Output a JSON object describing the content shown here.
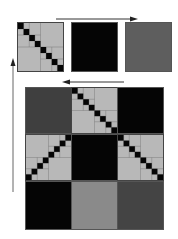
{
  "colors": {
    "background": "#ffffff",
    "light_gray": "#b8b8b8",
    "medium_gray": "#8a8a8a",
    "dark_gray": "#444444",
    "black": "#050505",
    "arrow": "#333333"
  },
  "top_row": {
    "cells": [
      {
        "type": "diagonal",
        "orientation": "main"
      },
      {
        "type": "solid",
        "fill": "black"
      },
      {
        "type": "solid",
        "fill": "dark_gray_medium"
      }
    ]
  },
  "arrows": [
    {
      "name": "top-right-arrow",
      "direction": "right"
    },
    {
      "name": "middle-left-arrow",
      "direction": "left"
    },
    {
      "name": "left-up-arrow",
      "direction": "up"
    }
  ],
  "main_grid": {
    "rows": 3,
    "cols": 3,
    "cells": [
      {
        "type": "solid",
        "fill": "dark_gray"
      },
      {
        "type": "diagonal",
        "orientation": "main"
      },
      {
        "type": "solid",
        "fill": "black"
      },
      {
        "type": "diagonal",
        "orientation": "anti"
      },
      {
        "type": "solid",
        "fill": "black"
      },
      {
        "type": "diagonal",
        "orientation": "main"
      },
      {
        "type": "solid",
        "fill": "black"
      },
      {
        "type": "solid",
        "fill": "medium_gray"
      },
      {
        "type": "solid",
        "fill": "dark_gray"
      }
    ]
  }
}
